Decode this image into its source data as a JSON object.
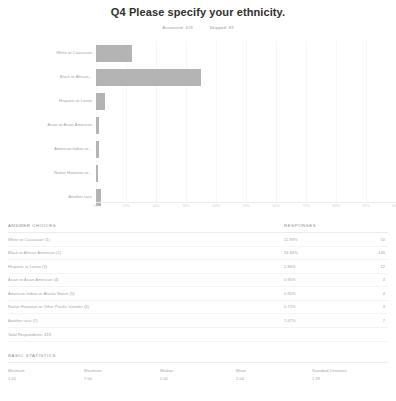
{
  "header": {
    "title": "Q4 Please specify your ethnicity.",
    "answered_label": "Answered: 419",
    "skipped_label": "Skipped: 83"
  },
  "chart_data": {
    "type": "bar",
    "orientation": "horizontal",
    "title": "Q4 Please specify your ethnicity.",
    "xlabel": "",
    "ylabel": "",
    "xlim": [
      0,
      100
    ],
    "grid": true,
    "legend": "none",
    "categories": [
      "White or Caucasian",
      "Black or African...",
      "Hispanic or Latino",
      "Asian or Asian American",
      "American Indian or...",
      "Native Hawaiian or...",
      "Another race"
    ],
    "values": [
      11.93,
      34.84,
      2.86,
      0.95,
      0.95,
      0.72,
      1.67
    ],
    "counts": [
      50,
      146,
      12,
      4,
      4,
      3,
      7
    ],
    "tick_labels": [
      "0%",
      "10%",
      "20%",
      "30%",
      "40%",
      "50%",
      "60%",
      "70%",
      "80%",
      "90%",
      "100%"
    ],
    "tick_values": [
      0,
      10,
      20,
      30,
      40,
      50,
      60,
      70,
      80,
      90,
      100
    ],
    "bar_color": "#b4b4b4"
  },
  "answer_table": {
    "col_choices": "ANSWER CHOICES",
    "col_responses": "RESPONSES",
    "rows": [
      {
        "label": "White or Caucasian (1)",
        "percent": "11.93%",
        "count": "50"
      },
      {
        "label": "Black or African American (2)",
        "percent": "34.84%",
        "count": "146"
      },
      {
        "label": "Hispanic or Latino (3)",
        "percent": "2.86%",
        "count": "12"
      },
      {
        "label": "Asian or Asian American (4)",
        "percent": "0.95%",
        "count": "4"
      },
      {
        "label": "American Indian or Alaska Native (5)",
        "percent": "0.95%",
        "count": "4"
      },
      {
        "label": "Native Hawaiian or Other Pacific Islander (6)",
        "percent": "0.72%",
        "count": "3"
      },
      {
        "label": "Another race (7)",
        "percent": "1.67%",
        "count": "7"
      }
    ],
    "total_label": "Total Respondents: 419"
  },
  "stats": {
    "heading": "BASIC STATISTICS",
    "cells": [
      {
        "label": "Minimum",
        "value": "1.00"
      },
      {
        "label": "Maximum",
        "value": "7.00"
      },
      {
        "label": "Median",
        "value": "2.00"
      },
      {
        "label": "Mean",
        "value": "2.04"
      },
      {
        "label": "Standard Deviation",
        "value": "1.99"
      }
    ]
  }
}
